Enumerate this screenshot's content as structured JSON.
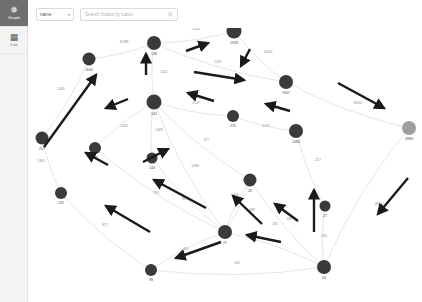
{
  "app": {
    "background": "#ffffff",
    "node_color": "#3a3a3a",
    "node_color_dim": "#9e9e9e",
    "edge_color": "#c8c8c8",
    "annotation_color": "#1a1a1a"
  },
  "rail": {
    "items": [
      {
        "id": "graph",
        "label": "Graph",
        "icon": "graph-icon",
        "glyph": "✵",
        "active": true
      },
      {
        "id": "list",
        "label": "List",
        "icon": "list-icon",
        "glyph": "▦",
        "active": false
      }
    ]
  },
  "toolbar": {
    "property_select": {
      "value": "name",
      "chevron": "▾"
    },
    "search": {
      "placeholder": "Search Nodes by Label",
      "icon": "search-icon",
      "value": ""
    }
  },
  "graph_data": {
    "type": "node-link-graph",
    "nodes": [
      {
        "id": "257",
        "label": "257",
        "x": 14,
        "y": 110,
        "r": 6.5,
        "dim": false
      },
      {
        "id": "1140",
        "label": "1140",
        "x": 61,
        "y": 31,
        "r": 6.5,
        "dim": false
      },
      {
        "id": "148",
        "label": "148",
        "x": 126,
        "y": 15,
        "r": 7.0,
        "dim": false
      },
      {
        "id": "1928",
        "label": "1928",
        "x": 206,
        "y": 3,
        "r": 7.5,
        "dim": false
      },
      {
        "id": "1907",
        "label": "1907",
        "x": 258,
        "y": 54,
        "r": 7.0,
        "dim": false
      },
      {
        "id": "2880",
        "label": "2880",
        "x": 381,
        "y": 100,
        "r": 7.0,
        "dim": true
      },
      {
        "id": "142",
        "label": "142",
        "x": 126,
        "y": 74,
        "r": 7.5,
        "dim": false
      },
      {
        "id": "215",
        "label": "215",
        "x": 205,
        "y": 88,
        "r": 6.0,
        "dim": false
      },
      {
        "id": "1083",
        "label": "1083",
        "x": 268,
        "y": 103,
        "r": 7.0,
        "dim": false
      },
      {
        "id": "145",
        "label": "145",
        "x": 67,
        "y": 120,
        "r": 6.0,
        "dim": false
      },
      {
        "id": "143",
        "label": "143",
        "x": 124,
        "y": 130,
        "r": 5.5,
        "dim": false
      },
      {
        "id": "137",
        "label": "137",
        "x": 33,
        "y": 165,
        "r": 6.0,
        "dim": false
      },
      {
        "id": "32",
        "label": "32",
        "x": 222,
        "y": 152,
        "r": 6.5,
        "dim": false
      },
      {
        "id": "27",
        "label": "27",
        "x": 297,
        "y": 178,
        "r": 5.5,
        "dim": false
      },
      {
        "id": "71",
        "label": "71",
        "x": 197,
        "y": 204,
        "r": 7.0,
        "dim": false
      },
      {
        "id": "98",
        "label": "98",
        "x": 123,
        "y": 242,
        "r": 6.0,
        "dim": false
      },
      {
        "id": "24",
        "label": "24",
        "x": 296,
        "y": 239,
        "r": 7.0,
        "dim": false
      }
    ],
    "edges": [
      {
        "source": "257",
        "target": "1140",
        "label": "2565",
        "lx": 33,
        "ly": 62
      },
      {
        "source": "1140",
        "target": "148",
        "label": "11398",
        "lx": 96,
        "ly": 15
      },
      {
        "source": "148",
        "target": "1928",
        "label": "1426",
        "lx": 168,
        "ly": 2
      },
      {
        "source": "1928",
        "target": "1907",
        "label": "13007",
        "lx": 240,
        "ly": 25
      },
      {
        "source": "148",
        "target": "1907",
        "label": "1475",
        "lx": 190,
        "ly": 35
      },
      {
        "source": "148",
        "target": "142",
        "label": "1412",
        "lx": 136,
        "ly": 45
      },
      {
        "source": "142",
        "target": "215",
        "label": "2137",
        "lx": 168,
        "ly": 76
      },
      {
        "source": "215",
        "target": "1083",
        "label": "1553",
        "lx": 238,
        "ly": 99
      },
      {
        "source": "1907",
        "target": "2880",
        "label": "28011",
        "lx": 330,
        "ly": 76
      },
      {
        "source": "1083",
        "target": "27",
        "label": "217",
        "lx": 290,
        "ly": 133
      },
      {
        "source": "142",
        "target": "143",
        "label": "1409",
        "lx": 131,
        "ly": 103
      },
      {
        "source": "142",
        "target": "145",
        "label": "1420",
        "lx": 96,
        "ly": 99
      },
      {
        "source": "257",
        "target": "137",
        "label": "1305",
        "lx": 13,
        "ly": 134
      },
      {
        "source": "137",
        "target": "98",
        "label": "872",
        "lx": 77,
        "ly": 198
      },
      {
        "source": "145",
        "target": "71",
        "label": "763",
        "lx": 128,
        "ly": 166
      },
      {
        "source": "142",
        "target": "71",
        "label": "761",
        "lx": 156,
        "ly": 172
      },
      {
        "source": "143",
        "target": "71",
        "label": "1408",
        "lx": 167,
        "ly": 139
      },
      {
        "source": "71",
        "target": "32",
        "label": "716",
        "lx": 208,
        "ly": 168
      },
      {
        "source": "32",
        "target": "71",
        "label": "699",
        "lx": 224,
        "ly": 183
      },
      {
        "source": "142",
        "target": "32",
        "label": "717",
        "lx": 178,
        "ly": 113
      },
      {
        "source": "71",
        "target": "98",
        "label": "691",
        "lx": 158,
        "ly": 222
      },
      {
        "source": "98",
        "target": "24",
        "label": "242",
        "lx": 209,
        "ly": 236
      },
      {
        "source": "24",
        "target": "71",
        "label": "245",
        "lx": 247,
        "ly": 197
      },
      {
        "source": "32",
        "target": "24",
        "label": "248",
        "lx": 261,
        "ly": 192
      },
      {
        "source": "27",
        "target": "24",
        "label": "240",
        "lx": 296,
        "ly": 209
      },
      {
        "source": "2880",
        "target": "24",
        "label": "28390",
        "lx": 351,
        "ly": 177
      }
    ],
    "annotations": [
      {
        "id": "a1",
        "x1": 16,
        "y1": 119,
        "x2": 68,
        "y2": 47
      },
      {
        "id": "a2",
        "x1": 118,
        "y1": 47,
        "x2": 118,
        "y2": 26
      },
      {
        "id": "a3",
        "x1": 158,
        "y1": 23,
        "x2": 180,
        "y2": 15
      },
      {
        "id": "a4",
        "x1": 166,
        "y1": 44,
        "x2": 216,
        "y2": 52
      },
      {
        "id": "a5",
        "x1": 222,
        "y1": 21,
        "x2": 213,
        "y2": 38
      },
      {
        "id": "a6",
        "x1": 186,
        "y1": 73,
        "x2": 160,
        "y2": 65
      },
      {
        "id": "a7",
        "x1": 262,
        "y1": 83,
        "x2": 238,
        "y2": 76
      },
      {
        "id": "a8",
        "x1": 310,
        "y1": 55,
        "x2": 356,
        "y2": 80
      },
      {
        "id": "a9",
        "x1": 100,
        "y1": 71,
        "x2": 78,
        "y2": 80
      },
      {
        "id": "a10",
        "x1": 178,
        "y1": 180,
        "x2": 126,
        "y2": 152
      },
      {
        "id": "a11",
        "x1": 122,
        "y1": 204,
        "x2": 78,
        "y2": 178
      },
      {
        "id": "a12",
        "x1": 115,
        "y1": 134,
        "x2": 140,
        "y2": 121
      },
      {
        "id": "a13",
        "x1": 234,
        "y1": 196,
        "x2": 205,
        "y2": 168
      },
      {
        "id": "a14",
        "x1": 286,
        "y1": 204,
        "x2": 286,
        "y2": 162
      },
      {
        "id": "a15",
        "x1": 380,
        "y1": 150,
        "x2": 350,
        "y2": 186
      },
      {
        "id": "a16",
        "x1": 193,
        "y1": 214,
        "x2": 148,
        "y2": 230
      },
      {
        "id": "a17",
        "x1": 253,
        "y1": 214,
        "x2": 219,
        "y2": 207
      },
      {
        "id": "a18",
        "x1": 270,
        "y1": 193,
        "x2": 247,
        "y2": 176
      },
      {
        "id": "a19",
        "x1": 80,
        "y1": 137,
        "x2": 58,
        "y2": 125
      }
    ]
  }
}
